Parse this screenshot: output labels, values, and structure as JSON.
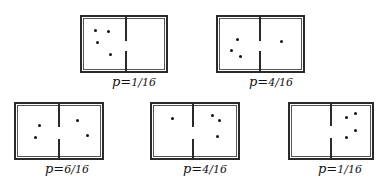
{
  "diagram": {
    "panels": [
      {
        "label": "p=",
        "fraction": "1/16",
        "box": {
          "x": 80,
          "y": 15,
          "w": 88,
          "h": 58
        },
        "divider_x": 126,
        "gap": [
          41,
          51
        ],
        "left_dots": [
          [
            95,
            30
          ],
          [
            108,
            31
          ],
          [
            97,
            42
          ],
          [
            110,
            54
          ]
        ],
        "right_dots": []
      },
      {
        "label": "p=",
        "fraction": "4/16",
        "box": {
          "x": 216,
          "y": 15,
          "w": 89,
          "h": 58
        },
        "divider_x": 260,
        "gap": [
          41,
          51
        ],
        "left_dots": [
          [
            237,
            39
          ],
          [
            231,
            50
          ],
          [
            240,
            56
          ]
        ],
        "right_dots": [
          [
            281,
            41
          ]
        ]
      },
      {
        "label": "p=",
        "fraction": "6/16",
        "box": {
          "x": 14,
          "y": 102,
          "w": 90,
          "h": 58
        },
        "divider_x": 59,
        "gap": [
          127,
          139
        ],
        "left_dots": [
          [
            39,
            125
          ],
          [
            35,
            137
          ]
        ],
        "right_dots": [
          [
            77,
            120
          ],
          [
            87,
            135
          ]
        ]
      },
      {
        "label": "p=",
        "fraction": "4/16",
        "box": {
          "x": 150,
          "y": 102,
          "w": 90,
          "h": 58
        },
        "divider_x": 193,
        "gap": [
          127,
          139
        ],
        "left_dots": [
          [
            172,
            118
          ]
        ],
        "right_dots": [
          [
            212,
            115
          ],
          [
            219,
            120
          ],
          [
            217,
            136
          ]
        ]
      },
      {
        "label": "p=",
        "fraction": "1/16",
        "box": {
          "x": 288,
          "y": 102,
          "w": 86,
          "h": 58
        },
        "divider_x": 331,
        "gap": [
          126,
          138
        ],
        "left_dots": [],
        "right_dots": [
          [
            346,
            117
          ],
          [
            355,
            113
          ],
          [
            355,
            130
          ],
          [
            346,
            137
          ]
        ]
      }
    ],
    "colors": {
      "ink": "#2a2a2a",
      "background": "#ffffff"
    }
  }
}
